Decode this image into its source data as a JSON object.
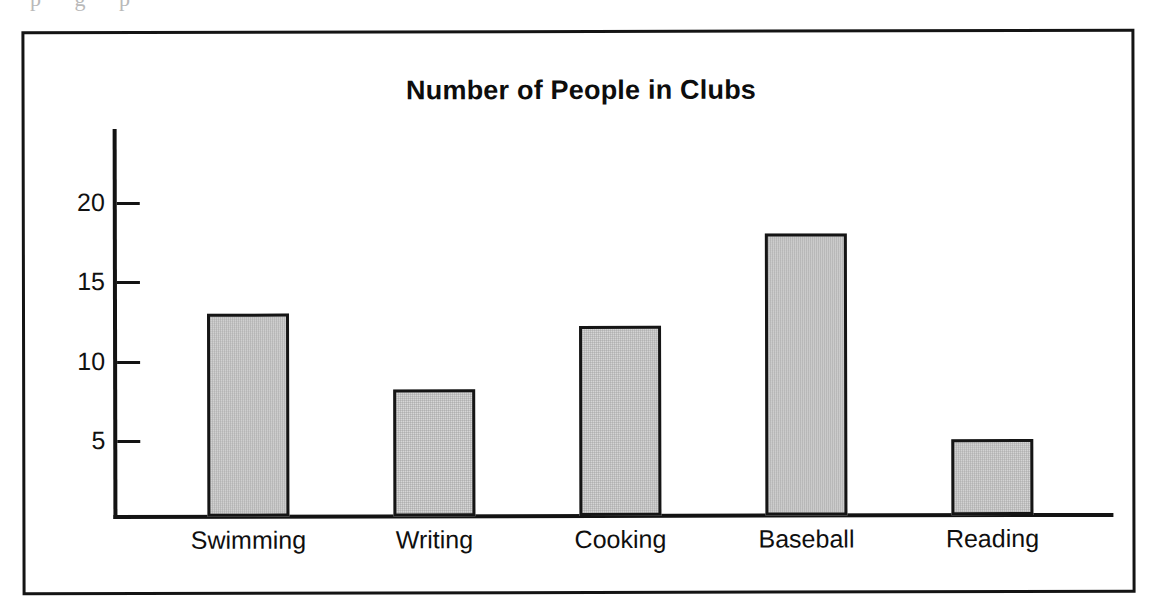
{
  "scan_remnant": "p g p",
  "figure": {
    "frame_color": "#141414",
    "background": "#ffffff"
  },
  "chart_data": {
    "type": "bar",
    "title": "Number of People in Clubs",
    "xlabel": "",
    "ylabel": "",
    "categories": [
      "Swimming",
      "Writing",
      "Cooking",
      "Baseball",
      "Reading"
    ],
    "values": [
      12.8,
      8.0,
      12.0,
      17.8,
      4.8
    ],
    "yticks": [
      5,
      10,
      15,
      20
    ],
    "ytick_labels": [
      "5",
      "10",
      "15",
      "20"
    ],
    "ylim": [
      0,
      24.5
    ],
    "grid": false,
    "legend": null,
    "bar_fill_color": "#d6d6d6",
    "bar_edge_color": "#151515",
    "axis_color": "#131313"
  }
}
